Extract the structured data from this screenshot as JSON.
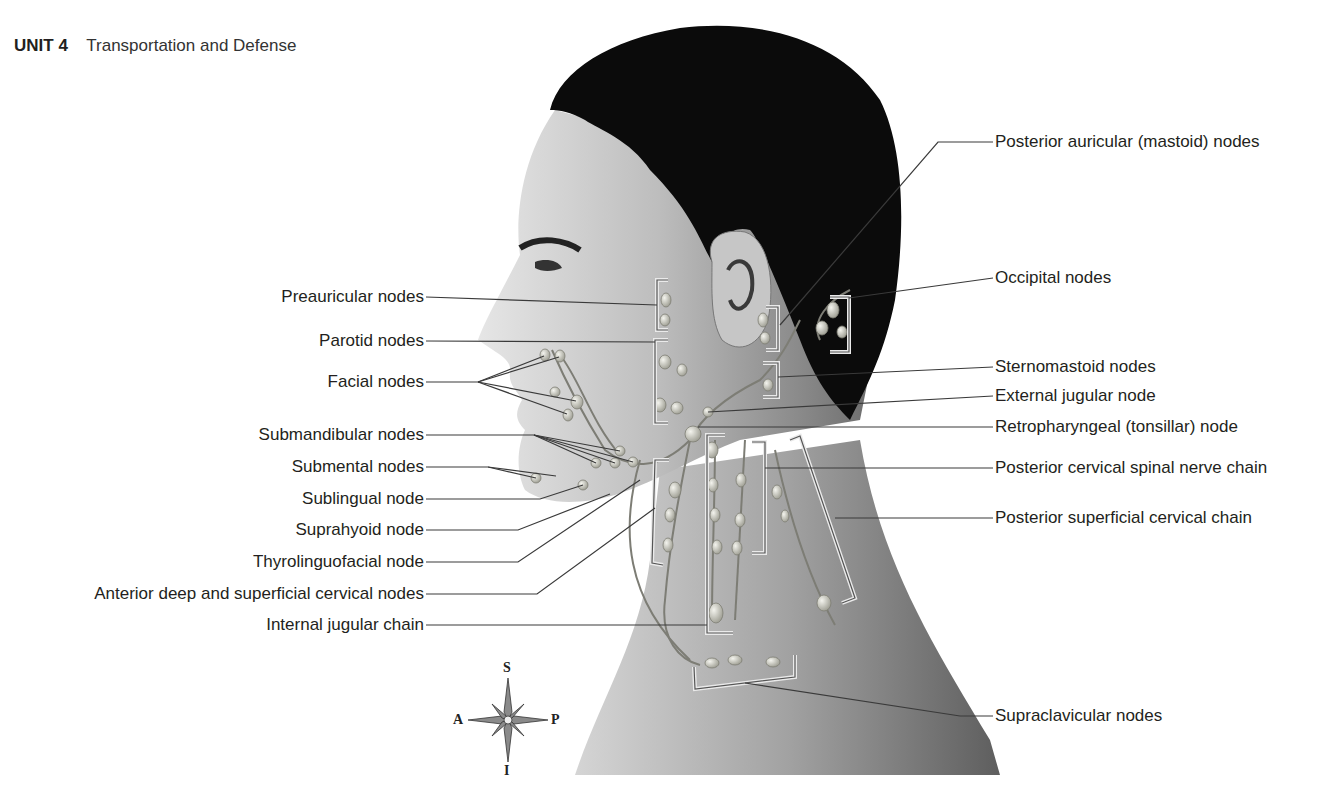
{
  "header": {
    "unit": "UNIT 4",
    "title": "Transportation and Defense"
  },
  "labels_left": [
    {
      "id": "preauricular",
      "text": "Preauricular nodes",
      "x_right": 424,
      "y": 297
    },
    {
      "id": "parotid",
      "text": "Parotid nodes",
      "x_right": 424,
      "y": 341
    },
    {
      "id": "facial",
      "text": "Facial nodes",
      "x_right": 424,
      "y": 382
    },
    {
      "id": "submandibular",
      "text": "Submandibular nodes",
      "x_right": 424,
      "y": 435
    },
    {
      "id": "submental",
      "text": "Submental nodes",
      "x_right": 424,
      "y": 467
    },
    {
      "id": "sublingual",
      "text": "Sublingual node",
      "x_right": 424,
      "y": 499
    },
    {
      "id": "suprahyoid",
      "text": "Suprahyoid node",
      "x_right": 424,
      "y": 530
    },
    {
      "id": "thyrolinguofacial",
      "text": "Thyrolinguofacial node",
      "x_right": 424,
      "y": 562
    },
    {
      "id": "anterior-cervical",
      "text": "Anterior deep and superficial cervical nodes",
      "x_right": 424,
      "y": 594
    },
    {
      "id": "internal-jugular",
      "text": "Internal jugular chain",
      "x_right": 424,
      "y": 625
    }
  ],
  "labels_right": [
    {
      "id": "posterior-auricular",
      "text": "Posterior auricular (mastoid) nodes",
      "x": 995,
      "y": 142
    },
    {
      "id": "occipital",
      "text": "Occipital nodes",
      "x": 995,
      "y": 278
    },
    {
      "id": "sternomastoid",
      "text": "Sternomastoid nodes",
      "x": 995,
      "y": 367
    },
    {
      "id": "external-jugular",
      "text": "External jugular node",
      "x": 995,
      "y": 396
    },
    {
      "id": "retropharyngeal",
      "text": "Retropharyngeal (tonsillar) node",
      "x": 995,
      "y": 427
    },
    {
      "id": "posterior-cervical-spinal",
      "text": "Posterior cervical spinal nerve chain",
      "x": 995,
      "y": 468
    },
    {
      "id": "posterior-superficial-cervical",
      "text": "Posterior superficial cervical chain",
      "x": 995,
      "y": 518
    },
    {
      "id": "supraclavicular",
      "text": "Supraclavicular nodes",
      "x": 995,
      "y": 716
    }
  ],
  "compass": {
    "superior": "S",
    "inferior": "I",
    "anterior": "A",
    "posterior": "P"
  },
  "colors": {
    "text": "#231f20",
    "leader_line": "#3a3a3a",
    "hair": "#0b0b0b",
    "skin_light": "#d9d9d9",
    "skin_mid": "#a8a8a8",
    "skin_dark": "#5a5a5a",
    "node": "#cfcfc6",
    "bracket": "#e8e8e8"
  }
}
